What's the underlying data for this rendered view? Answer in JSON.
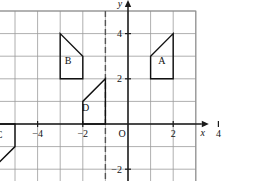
{
  "figure": {
    "type": "coordinate-plane",
    "background_color": "#ffffff",
    "grid_color": "#9a9a9a",
    "axis_color": "#1a1a1a",
    "shape_color": "#111111",
    "dashed_color": "#555555"
  },
  "axes": {
    "x_axis_label": "x",
    "y_axis_label": "y",
    "origin_label": "O",
    "x_ticks": [
      {
        "value": -4,
        "label": "−4"
      },
      {
        "value": -2,
        "label": "−2"
      },
      {
        "value": 2,
        "label": "2"
      },
      {
        "value": 4,
        "label": "4"
      }
    ],
    "y_ticks": [
      {
        "value": 4,
        "label": "4"
      },
      {
        "value": 2,
        "label": "2"
      },
      {
        "value": -2,
        "label": "−2"
      }
    ],
    "x_range": [
      -7,
      3
    ],
    "y_range": [
      -3,
      5
    ],
    "grid_step": 1,
    "grid_visible": true
  },
  "dashed_line": {
    "orientation": "vertical",
    "x_value": -1
  },
  "shapes": [
    {
      "id": "A",
      "label": "A",
      "label_point": [
        1.5,
        2.8
      ],
      "vertices": [
        [
          1,
          2
        ],
        [
          1,
          3
        ],
        [
          2,
          4
        ],
        [
          2,
          2
        ]
      ]
    },
    {
      "id": "B",
      "label": "B",
      "label_point": [
        -2.65,
        2.8
      ],
      "vertices": [
        [
          -3,
          2
        ],
        [
          -3,
          4
        ],
        [
          -2,
          3
        ],
        [
          -2,
          2
        ]
      ]
    },
    {
      "id": "C",
      "label": "C",
      "label_point": [
        -5.7,
        -0.45
      ],
      "vertices": [
        [
          -6,
          0
        ],
        [
          -6,
          -2
        ],
        [
          -5,
          -1
        ],
        [
          -5,
          0
        ]
      ]
    },
    {
      "id": "D",
      "label": "D",
      "label_point": [
        -1.88,
        0.75
      ],
      "vertices": [
        [
          -2,
          0
        ],
        [
          -2,
          1
        ],
        [
          -1,
          2
        ],
        [
          -1,
          0
        ]
      ]
    }
  ],
  "chart_data": {
    "type": "scatter",
    "title": "",
    "xlabel": "x",
    "ylabel": "y",
    "xlim": [
      -7,
      3
    ],
    "ylim": [
      -3,
      5
    ],
    "grid": true,
    "legend": "none",
    "annotations": [
      {
        "text": "A",
        "x": 1.5,
        "y": 2.8
      },
      {
        "text": "B",
        "x": -2.65,
        "y": 2.8
      },
      {
        "text": "C",
        "x": -5.7,
        "y": -0.45
      },
      {
        "text": "D",
        "x": -1.88,
        "y": 0.75
      },
      {
        "text": "O",
        "x": -0.45,
        "y": -0.55
      }
    ],
    "series": [
      {
        "name": "A",
        "values": [
          [
            1,
            2
          ],
          [
            1,
            3
          ],
          [
            2,
            4
          ],
          [
            2,
            2
          ]
        ]
      },
      {
        "name": "B",
        "values": [
          [
            -3,
            2
          ],
          [
            -3,
            4
          ],
          [
            -2,
            3
          ],
          [
            -2,
            2
          ]
        ]
      },
      {
        "name": "C",
        "values": [
          [
            -6,
            0
          ],
          [
            -6,
            -2
          ],
          [
            -5,
            -1
          ],
          [
            -5,
            0
          ]
        ]
      },
      {
        "name": "D",
        "values": [
          [
            -2,
            0
          ],
          [
            -2,
            1
          ],
          [
            -1,
            2
          ],
          [
            -1,
            0
          ]
        ]
      }
    ]
  }
}
